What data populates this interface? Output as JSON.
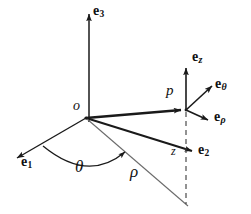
{
  "figure": {
    "background_color": "#ffffff",
    "stroke_color": "#1a1a1a",
    "thin_stroke_color": "#555555",
    "width": 251,
    "height": 214
  },
  "labels": {
    "e3": {
      "base": "e",
      "sub": "3",
      "x": 93,
      "y": 11
    },
    "ez": {
      "base": "e",
      "sub": "z",
      "x": 192,
      "y": 57
    },
    "etheta": {
      "base": "e",
      "sub": "θ",
      "x": 219,
      "y": 84
    },
    "erho": {
      "base": "e",
      "sub": "ρ",
      "x": 218,
      "y": 117
    },
    "e1": {
      "base": "e",
      "sub": "1",
      "x": 21,
      "y": 161
    },
    "e2": {
      "base": "e",
      "sub": "2",
      "x": 199,
      "y": 148
    },
    "origin": {
      "text": "o",
      "x": 76,
      "y": 105
    },
    "point_p": {
      "text": "p",
      "x": 168,
      "y": 88
    },
    "z": {
      "text": "z",
      "x": 172,
      "y": 150
    },
    "theta": {
      "text": "θ",
      "x": 76,
      "y": 159
    },
    "rho": {
      "text": "ρ",
      "x": 131,
      "y": 166
    }
  },
  "geometry": {
    "origin_point": {
      "x": 86,
      "y": 118
    },
    "p_point": {
      "x": 186,
      "y": 110
    },
    "foot_point": {
      "x": 186,
      "y": 203
    },
    "e3_axis": {
      "x1": 89,
      "y1": 122,
      "x2": 89,
      "y2": 11
    },
    "e1_axis": {
      "x1": 86,
      "y1": 118,
      "x2": 14,
      "y2": 160
    },
    "e2_axis": {
      "x1": 86,
      "y1": 118,
      "x2": 196,
      "y2": 152
    },
    "op_vector": {
      "x1": 86,
      "y1": 118,
      "x2": 186,
      "y2": 110
    },
    "ez_vector": {
      "x1": 186,
      "y1": 110,
      "x2": 186,
      "y2": 65
    },
    "etheta_vector": {
      "x1": 186,
      "y1": 110,
      "x2": 216,
      "y2": 82
    },
    "erho_vector": {
      "x1": 186,
      "y1": 110,
      "x2": 213,
      "y2": 122
    },
    "rho_ray": {
      "x1": 86,
      "y1": 118,
      "x2": 188,
      "y2": 206
    },
    "dashed_drop": {
      "x1": 186,
      "y1": 112,
      "x2": 186,
      "y2": 204
    },
    "theta_arc": {
      "start_x": 43,
      "start_y": 147,
      "end_x": 129,
      "end_y": 154,
      "sweep_radius": 66
    }
  },
  "legend": {
    "description": "Cartesian basis e1, e2, e3 at origin o; cylindrical basis e_rho, e_theta, e_z at point p; polar radius rho, azimuth angle theta, height z."
  }
}
